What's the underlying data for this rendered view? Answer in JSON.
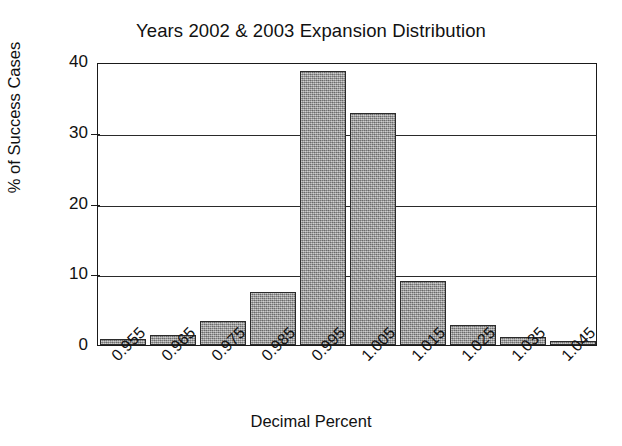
{
  "chart_data": {
    "type": "bar",
    "title": "Years 2002 & 2003 Expansion Distribution",
    "xlabel": "Decimal Percent",
    "ylabel": "% of Success Cases",
    "categories": [
      "0.955",
      "0.965",
      "0.975",
      "0.985",
      "0.995",
      "1.005",
      "1.015",
      "1.025",
      "1.035",
      "1.045"
    ],
    "values": [
      0.9,
      1.4,
      3.4,
      7.5,
      38.8,
      32.8,
      9.0,
      2.8,
      1.2,
      0.5
    ],
    "ylim": [
      0,
      40
    ],
    "yticks": [
      "0",
      "10",
      "20",
      "30",
      "40"
    ],
    "ytick_values": [
      0,
      10,
      20,
      30,
      40
    ],
    "gridlines": [
      10,
      20,
      30
    ],
    "grid": true,
    "legend": null,
    "bar_color": "#9d9d9d",
    "bar_edge_color": "#2b2b2b",
    "axis_color": "#1a1a1a",
    "background_color": "#ffffff",
    "xtick_rotation": -45
  }
}
